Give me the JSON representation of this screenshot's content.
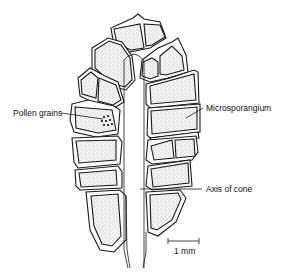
{
  "diagram": {
    "labels": {
      "pollen_grains": "Pollen grains",
      "microsporangium": "Microsporangium",
      "axis_of_cone": "Axis of cone",
      "scale_bar": "1 mm"
    },
    "colors": {
      "ink": "#1a1a1a",
      "background": "#ffffff",
      "stipple": "#c8c8c8"
    }
  }
}
